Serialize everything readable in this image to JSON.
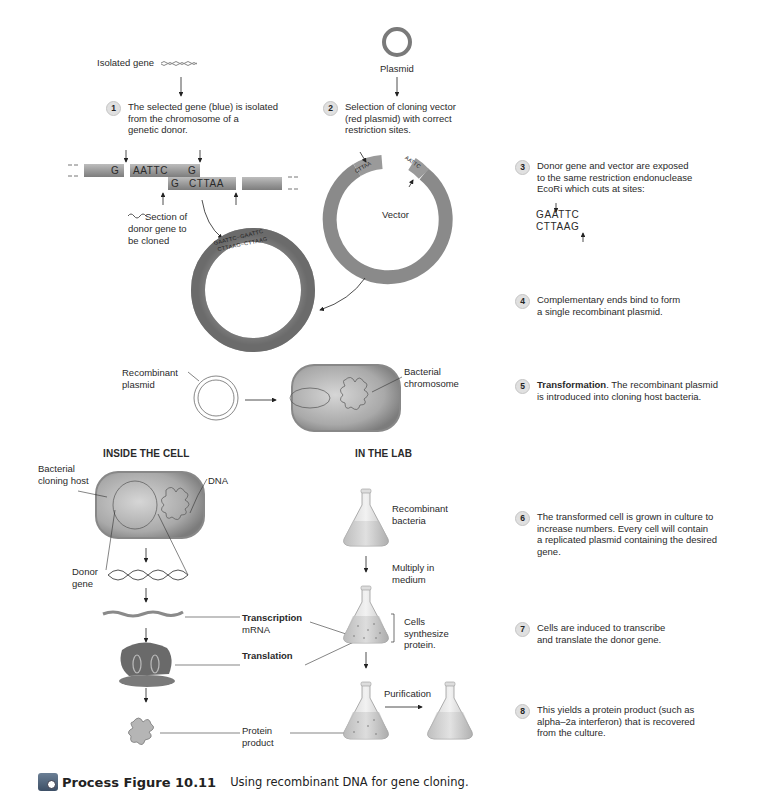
{
  "figure": {
    "label": "Process Figure 10.11",
    "title": "Using recombinant DNA for gene cloning.",
    "icon": "process-figure-icon"
  },
  "top": {
    "isolated_gene_label": "Isolated gene",
    "plasmid_label": "Plasmid",
    "vector_label": "Vector",
    "section_label": [
      "Section of",
      "donor gene to",
      "be cloned"
    ],
    "donor_strand": {
      "left_top": "G",
      "mid_top": "AATTC",
      "mid_top_end": "G",
      "mid_bottom_start": "G",
      "mid_bottom": "CTTAA"
    },
    "vector_ends": {
      "left_outer": "G",
      "left_inner": "CTTAA",
      "right_outer": "AATTC",
      "right_inner": "G"
    },
    "recombinant_ring": {
      "top": "GAATTC~GAATTC",
      "bottom": "CTTAAG~CTTAAG"
    }
  },
  "middle": {
    "recombinant_plasmid_label": [
      "Recombinant",
      "plasmid"
    ],
    "bacterial_chromosome_label": [
      "Bacterial",
      "chromosome"
    ]
  },
  "sections": {
    "inside_cell": "INSIDE THE CELL",
    "in_lab": "IN THE LAB"
  },
  "inside_cell": {
    "host_label": [
      "Bacterial",
      "cloning host"
    ],
    "dna_label": "DNA",
    "donor_gene_label": [
      "Donor",
      "gene"
    ],
    "transcription_label": "Transcription",
    "mrna_label": "mRNA",
    "translation_label": "Translation",
    "protein_label": [
      "Protein",
      "product"
    ]
  },
  "in_lab": {
    "recombinant_bacteria_label": [
      "Recombinant",
      "bacteria"
    ],
    "multiply_label": [
      "Multiply in",
      "medium"
    ],
    "cells_synthesize_label": [
      "Cells",
      "synthesize",
      "protein."
    ],
    "purification_label": "Purification"
  },
  "steps": [
    {
      "num": "1",
      "lines": [
        "The selected gene (blue) is isolated",
        "from the chromosome of a",
        "genetic donor."
      ]
    },
    {
      "num": "2",
      "lines": [
        "Selection of cloning vector",
        "(red plasmid) with correct",
        "restriction sites."
      ]
    },
    {
      "num": "3",
      "lines": [
        "Donor gene and vector are exposed",
        "to the same restriction endonuclease",
        "EcoRi which cuts at sites:"
      ],
      "seq": [
        "GAATTC",
        "CTTAAG"
      ]
    },
    {
      "num": "4",
      "lines": [
        "Complementary ends bind to form",
        "a single recombinant plasmid."
      ]
    },
    {
      "num": "5",
      "bold": "Transformation",
      "lines": [
        ". The recombinant plasmid",
        "is introduced into cloning host bacteria."
      ]
    },
    {
      "num": "6",
      "lines": [
        "The transformed cell is grown in culture to",
        "increase numbers. Every cell will contain",
        "a replicated plasmid containing the desired",
        "gene."
      ]
    },
    {
      "num": "7",
      "lines": [
        "Cells are induced to transcribe",
        "and translate the donor gene."
      ]
    },
    {
      "num": "8",
      "lines": [
        "This yields a protein product (such as",
        "alpha–2a interferon) that is recovered",
        "from the culture."
      ]
    }
  ]
}
